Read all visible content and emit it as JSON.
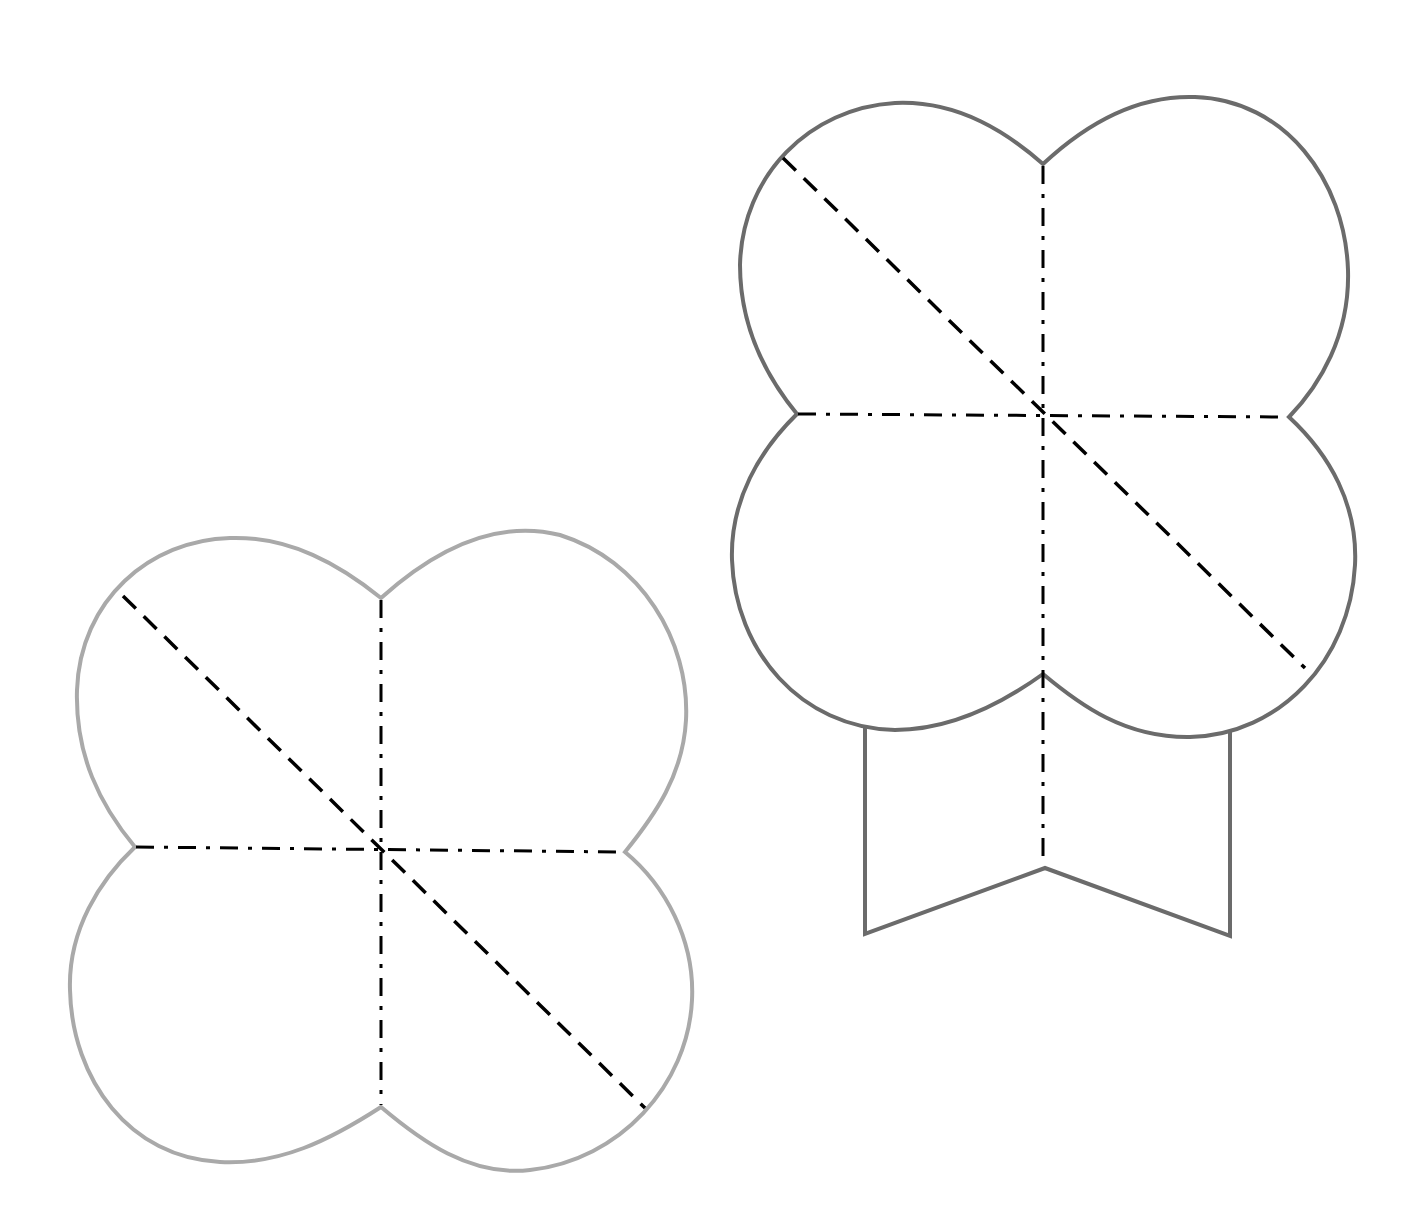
{
  "diagram": {
    "colors": {
      "left_outline": "#a9a9a9",
      "right_outline": "#6b6b6b",
      "fold_lines": "#000000",
      "background": "#ffffff"
    },
    "legend": {
      "dash_dot_line": "fold line (dash-dot)",
      "dashed_line": "diagonal fold line (dashed)"
    },
    "shapes": [
      {
        "name": "left-clover",
        "label": "Four-lobed template (flat)",
        "outline_color": "#a9a9a9",
        "center": [
          381,
          847
        ],
        "notches": {
          "top": [
            381,
            598
          ],
          "left": [
            135,
            847
          ],
          "right": [
            625,
            852
          ],
          "bottom": [
            381,
            1107
          ]
        },
        "diagonal": {
          "from": [
            123,
            596
          ],
          "to": [
            645,
            1108
          ]
        }
      },
      {
        "name": "right-clover-with-stand",
        "label": "Four-lobed template with stand",
        "outline_color": "#6b6b6b",
        "center": [
          1043,
          414
        ],
        "notches": {
          "top": [
            1043,
            164
          ],
          "left": [
            797,
            414
          ],
          "right": [
            1289,
            417
          ],
          "bottom": [
            1043,
            674
          ]
        },
        "diagonal": {
          "from": [
            783,
            158
          ],
          "to": [
            1305,
            668
          ]
        },
        "stand": {
          "left_x": 865,
          "right_x": 1230,
          "bottom_left": [
            865,
            934
          ],
          "bottom_right": [
            1230,
            936
          ],
          "v_point": [
            1045,
            868
          ]
        }
      }
    ]
  }
}
